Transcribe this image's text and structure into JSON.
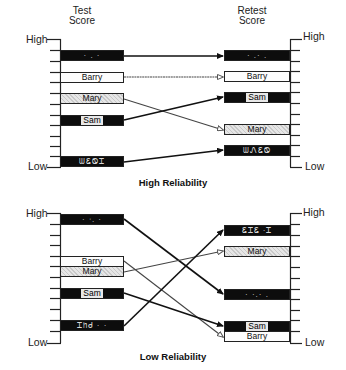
{
  "diagrams": [
    {
      "title": "High Reliability",
      "left_header": [
        "Test",
        "Score"
      ],
      "right_header": [
        "Retest",
        "Score"
      ],
      "axis": {
        "high": "High",
        "low": "Low"
      },
      "left_bars": [
        {
          "label": "",
          "style": "black",
          "noise": "·  .  ·"
        },
        {
          "label": "Barry",
          "style": "white"
        },
        {
          "label": "Mary",
          "style": "gray"
        },
        {
          "label": "Sam",
          "style": "black"
        },
        {
          "label": "",
          "style": "black",
          "noise": "ᗯᏋᏫᏆ"
        }
      ],
      "right_bars": [
        {
          "label": "",
          "style": "black",
          "noise": "· .· ."
        },
        {
          "label": "Barry",
          "style": "white"
        },
        {
          "label": "Sam",
          "style": "black"
        },
        {
          "label": "Mary",
          "style": "gray"
        },
        {
          "label": "",
          "style": "black",
          "noise": "ᗯᏁᏋᏫ"
        }
      ]
    },
    {
      "title": "Low Reliability",
      "left_header": [],
      "right_header": [],
      "axis": {
        "high": "High",
        "low": "Low"
      },
      "left_bars": [
        {
          "label": "",
          "style": "black",
          "noise": "· ᐧ. ·"
        },
        {
          "label": "Barry",
          "style": "white"
        },
        {
          "label": "Mary",
          "style": "gray"
        },
        {
          "label": "Sam",
          "style": "black"
        },
        {
          "label": "",
          "style": "black",
          "noise": "Ꮖᥒᑯ · ·"
        }
      ],
      "right_bars": [
        {
          "label": "",
          "style": "black",
          "noise": "ᏋᏆᏋ ·Ꮖ"
        },
        {
          "label": "Mary",
          "style": "gray"
        },
        {
          "label": "",
          "style": "black",
          "noise": "· ·.· ."
        },
        {
          "label": "Sam",
          "style": "black"
        },
        {
          "label": "Barry",
          "style": "white"
        }
      ]
    }
  ]
}
